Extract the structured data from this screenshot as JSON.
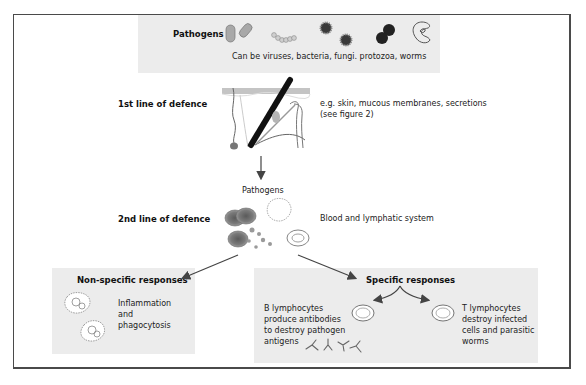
{
  "figure": {
    "pathogens_box": {
      "title": "Pathogens",
      "caption": "Can be viruses, bacteria, fungi. protozoa, worms",
      "icons": [
        "bacilli-icon",
        "cocci-chain-icon",
        "virus-icon",
        "fungi-spore-icon",
        "protozoa-icon"
      ]
    },
    "first_line": {
      "label": "1st line of defence",
      "desc_line1": "e.g. skin, mucous membranes, secretions",
      "desc_line2": "(see figure 2)",
      "icon": "skin-cross-section-icon"
    },
    "pathogens_label": "Pathogens",
    "second_line": {
      "label": "2nd line of defence",
      "desc": "Blood and lymphatic system",
      "icon": "blood-cells-icon"
    },
    "non_specific": {
      "title": "Non-specific responses",
      "text_lines": [
        "Inflammation",
        "and",
        "phagocytosis"
      ],
      "icon": "phagocyte-icon"
    },
    "specific": {
      "title": "Specific responses",
      "b_cells": {
        "text_lines": [
          "B lymphocytes",
          "produce antibodies",
          "to destroy pathogen",
          "antigens"
        ],
        "icon": "antibody-icon"
      },
      "t_cells": {
        "text_lines": [
          "T lymphocytes",
          "destroy infected",
          "cells and parasitic",
          "worms"
        ]
      }
    },
    "colors": {
      "box_fill": "#ececec",
      "frame": "#4a4a4a",
      "arrow": "#444444",
      "cell_red": "#8a8a8a",
      "cell_dark": "#2a2a2a"
    }
  }
}
